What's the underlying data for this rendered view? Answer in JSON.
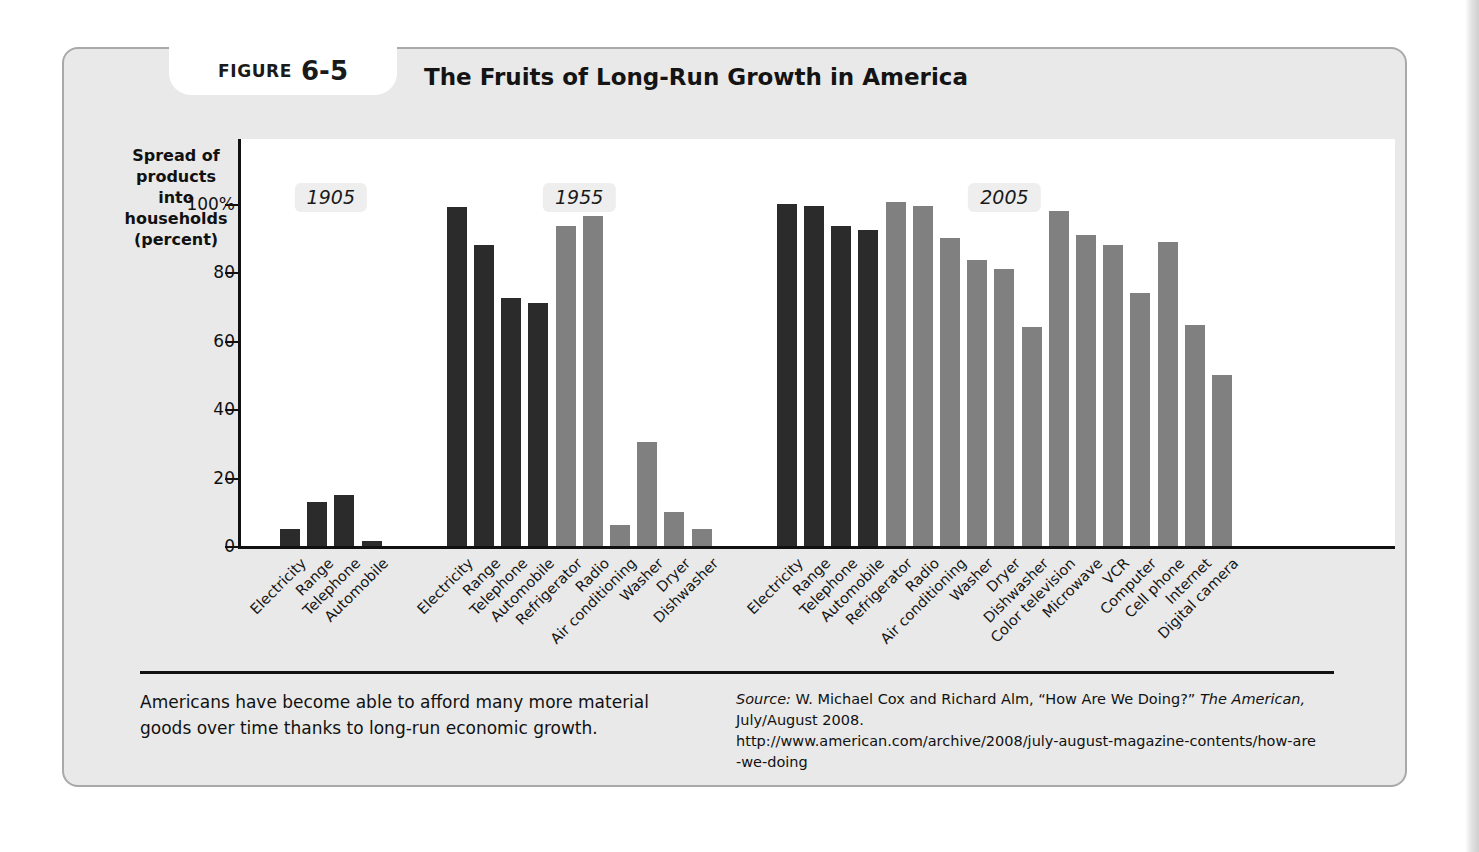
{
  "figure": {
    "label_word": "FIGURE",
    "label_number": "6-5",
    "title": "The Fruits of Long-Run Growth in America"
  },
  "axis": {
    "y_title": "Spread of products into households (percent)",
    "y_ticks": [
      "100%",
      "80",
      "60",
      "40",
      "20",
      "0"
    ],
    "y_tick_values": [
      100,
      80,
      60,
      40,
      20,
      0
    ]
  },
  "caption": "Americans have become able to afford many more material goods over time thanks to long-run economic growth.",
  "source": {
    "prefix": "Source:",
    "line1_rest": " W. Michael Cox and Richard Alm, “How Are We Doing?” ",
    "italic_pub": "The American,",
    "line2_rest": " July/August 2008.",
    "url": "http://www.american.com/archive/2008/july-august-magazine-contents/how-are-we-doing"
  },
  "colors": {
    "bar_dark": "#2b2b2b",
    "bar_light": "#808080",
    "panel": "#e9e9e9",
    "plot_bg": "#ffffff",
    "axis": "#111111",
    "era_chip": "#eeeeee"
  },
  "chart_data": {
    "type": "bar",
    "title": "The Fruits of Long-Run Growth in America",
    "xlabel": "",
    "ylabel": "Spread of products into households (percent)",
    "ylim": [
      0,
      105
    ],
    "yticks": [
      0,
      20,
      40,
      60,
      80,
      100
    ],
    "grid": false,
    "legend": "none",
    "group_label_position": "top",
    "groups": [
      {
        "label": "1905",
        "categories": [
          "Electricity",
          "Range",
          "Telephone",
          "Automobile"
        ],
        "values": [
          5,
          13,
          15,
          1.5
        ],
        "series_color": [
          "dark",
          "dark",
          "dark",
          "dark"
        ]
      },
      {
        "label": "1955",
        "categories": [
          "Electricity",
          "Range",
          "Telephone",
          "Automobile",
          "Refrigerator",
          "Radio",
          "Air conditioning",
          "Washer",
          "Dryer",
          "Dishwasher"
        ],
        "values": [
          99,
          88,
          72.5,
          71,
          93.5,
          96.5,
          6,
          30.5,
          10,
          5
        ],
        "series_color": [
          "dark",
          "dark",
          "dark",
          "dark",
          "light",
          "light",
          "light",
          "light",
          "light",
          "light"
        ]
      },
      {
        "label": "2005",
        "categories": [
          "Electricity",
          "Range",
          "Telephone",
          "Automobile",
          "Refrigerator",
          "Radio",
          "Air conditioning",
          "Washer",
          "Dryer",
          "Dishwasher",
          "Color television",
          "Microwave",
          "VCR",
          "Computer",
          "Cell phone",
          "Internet",
          "Digital camera"
        ],
        "values": [
          100,
          99.5,
          93.5,
          92.5,
          100.5,
          99.5,
          90,
          83.5,
          81,
          64,
          98,
          91,
          88,
          74,
          89,
          64.5,
          50
        ],
        "series_color": [
          "dark",
          "dark",
          "dark",
          "dark",
          "light",
          "light",
          "light",
          "light",
          "light",
          "light",
          "light",
          "light",
          "light",
          "light",
          "light",
          "light",
          "light"
        ]
      }
    ]
  }
}
